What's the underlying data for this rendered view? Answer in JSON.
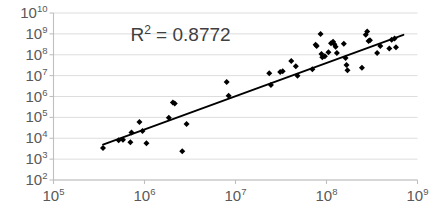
{
  "chart_data": {
    "type": "scatter",
    "title": "",
    "xlabel": "",
    "ylabel": "",
    "xscale": "log",
    "yscale": "log",
    "xlim": [
      100000,
      1000000000
    ],
    "ylim": [
      100,
      10000000000
    ],
    "grid": "horizontal",
    "legend": "none",
    "annotations": [
      {
        "text_prefix": "R",
        "text_sup": "2",
        "text_suffix": " = 0.8772",
        "value": 0.8772,
        "x": 700000,
        "y": 800000000
      }
    ],
    "xticks": [
      {
        "mantissa": "10",
        "exp": "5",
        "value": 100000
      },
      {
        "mantissa": "10",
        "exp": "6",
        "value": 1000000
      },
      {
        "mantissa": "10",
        "exp": "7",
        "value": 10000000
      },
      {
        "mantissa": "10",
        "exp": "8",
        "value": 100000000
      },
      {
        "mantissa": "10",
        "exp": "9",
        "value": 1000000000
      }
    ],
    "yticks": [
      {
        "mantissa": "10",
        "exp": "10",
        "value": 10000000000
      },
      {
        "mantissa": "10",
        "exp": "9",
        "value": 1000000000
      },
      {
        "mantissa": "10",
        "exp": "8",
        "value": 100000000
      },
      {
        "mantissa": "10",
        "exp": "7",
        "value": 10000000
      },
      {
        "mantissa": "10",
        "exp": "6",
        "value": 1000000
      },
      {
        "mantissa": "10",
        "exp": "5",
        "value": 100000
      },
      {
        "mantissa": "10",
        "exp": "4",
        "value": 10000
      },
      {
        "mantissa": "10",
        "exp": "3",
        "value": 1000
      },
      {
        "mantissa": "10",
        "exp": "2",
        "value": 100
      }
    ],
    "series": [
      {
        "name": "data",
        "marker": "diamond",
        "color": "#000000",
        "points": [
          [
            350000.0,
            3400.0
          ],
          [
            520000.0,
            8000.0
          ],
          [
            580000.0,
            8500.0
          ],
          [
            700000.0,
            6500.0
          ],
          [
            720000.0,
            19000.0
          ],
          [
            880000.0,
            60000.0
          ],
          [
            950000.0,
            22000.0
          ],
          [
            1050000.0,
            5800.0
          ],
          [
            1850000.0,
            95000.0
          ],
          [
            2050000.0,
            520000.0
          ],
          [
            2150000.0,
            460000.0
          ],
          [
            2600000.0,
            2400.0
          ],
          [
            2900000.0,
            48000.0
          ],
          [
            8000000.0,
            5000000.0
          ],
          [
            8400000.0,
            1100000.0
          ],
          [
            23500000.0,
            13000000.0
          ],
          [
            24500000.0,
            3600000.0
          ],
          [
            31000000.0,
            15000000.0
          ],
          [
            33000000.0,
            16000000.0
          ],
          [
            41000000.0,
            50000000.0
          ],
          [
            46000000.0,
            28000000.0
          ],
          [
            48000000.0,
            10000000.0
          ],
          [
            70000000.0,
            20000000.0
          ],
          [
            76000000.0,
            300000000.0
          ],
          [
            78000000.0,
            260000000.0
          ],
          [
            86000000.0,
            1000000000.0
          ],
          [
            88000000.0,
            110000000.0
          ],
          [
            90000000.0,
            75000000.0
          ],
          [
            96000000.0,
            85000000.0
          ],
          [
            105000000.0,
            130000000.0
          ],
          [
            112000000.0,
            360000000.0
          ],
          [
            118000000.0,
            420000000.0
          ],
          [
            122000000.0,
            320000000.0
          ],
          [
            126000000.0,
            240000000.0
          ],
          [
            130000000.0,
            120000000.0
          ],
          [
            155000000.0,
            340000000.0
          ],
          [
            162000000.0,
            70000000.0
          ],
          [
            166000000.0,
            32000000.0
          ],
          [
            170000000.0,
            18000000.0
          ],
          [
            245000000.0,
            24000000.0
          ],
          [
            270000000.0,
            900000000.0
          ],
          [
            280000000.0,
            1300000000.0
          ],
          [
            290000000.0,
            450000000.0
          ],
          [
            300000000.0,
            500000000.0
          ],
          [
            360000000.0,
            120000000.0
          ],
          [
            390000000.0,
            260000000.0
          ],
          [
            490000000.0,
            200000000.0
          ],
          [
            520000000.0,
            520000000.0
          ],
          [
            560000000.0,
            600000000.0
          ],
          [
            580000000.0,
            230000000.0
          ]
        ]
      }
    ],
    "trendline": {
      "color": "#000000",
      "x_start": 350000.0,
      "y_start": 5000.0,
      "x_end": 700000000.0,
      "y_end": 900000000.0
    }
  }
}
